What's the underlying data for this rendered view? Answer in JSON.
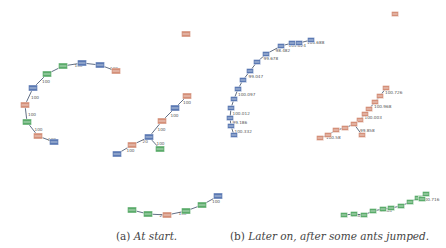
{
  "colors": {
    "blue": "#5b79b3",
    "salmon": "#d48f78",
    "green": "#5aab6a",
    "edge": "#3a4a66",
    "label": "#555555"
  },
  "captions": {
    "a": {
      "prefix": "(a)",
      "text": "At start."
    },
    "b": {
      "prefix": "(b)",
      "text": "Later on, after some ants jumped."
    }
  },
  "panels": [
    {
      "id": "a",
      "nodes": [
        {
          "x": 63,
          "y": 66,
          "c": "green"
        },
        {
          "x": 82,
          "y": 63,
          "c": "blue"
        },
        {
          "x": 100,
          "y": 65,
          "c": "blue"
        },
        {
          "x": 116,
          "y": 71,
          "c": "salmon"
        },
        {
          "x": 47,
          "y": 74,
          "c": "green"
        },
        {
          "x": 33,
          "y": 88,
          "c": "blue"
        },
        {
          "x": 25,
          "y": 105,
          "c": "salmon"
        },
        {
          "x": 27,
          "y": 122,
          "c": "green"
        },
        {
          "x": 38,
          "y": 136,
          "c": "salmon"
        },
        {
          "x": 54,
          "y": 142,
          "c": "blue"
        },
        {
          "x": 186,
          "y": 34,
          "c": "salmon"
        },
        {
          "x": 187,
          "y": 96,
          "c": "salmon"
        },
        {
          "x": 175,
          "y": 108,
          "c": "blue"
        },
        {
          "x": 162,
          "y": 121,
          "c": "salmon"
        },
        {
          "x": 149,
          "y": 137,
          "c": "blue"
        },
        {
          "x": 160,
          "y": 149,
          "c": "green"
        },
        {
          "x": 132,
          "y": 145,
          "c": "salmon"
        },
        {
          "x": 117,
          "y": 154,
          "c": "blue"
        },
        {
          "x": 132,
          "y": 210,
          "c": "green"
        },
        {
          "x": 148,
          "y": 214,
          "c": "green"
        },
        {
          "x": 167,
          "y": 215,
          "c": "salmon"
        },
        {
          "x": 186,
          "y": 211,
          "c": "green"
        },
        {
          "x": 202,
          "y": 205,
          "c": "green"
        },
        {
          "x": 218,
          "y": 196,
          "c": "blue"
        }
      ],
      "edges": [
        {
          "a": 0,
          "b": 1,
          "label": "100"
        },
        {
          "a": 1,
          "b": 2,
          "label": ""
        },
        {
          "a": 2,
          "b": 3,
          "label": "100"
        },
        {
          "a": 4,
          "b": 0,
          "label": ""
        },
        {
          "a": 5,
          "b": 4,
          "label": "100"
        },
        {
          "a": 6,
          "b": 5,
          "label": "100"
        },
        {
          "a": 7,
          "b": 6,
          "label": "100"
        },
        {
          "a": 8,
          "b": 7,
          "label": "100"
        },
        {
          "a": 9,
          "b": 8,
          "label": "100"
        },
        {
          "a": 11,
          "b": 12,
          "label": "100"
        },
        {
          "a": 12,
          "b": 13,
          "label": "100"
        },
        {
          "a": 13,
          "b": 14,
          "label": "100"
        },
        {
          "a": 14,
          "b": 15,
          "label": "100"
        },
        {
          "a": 14,
          "b": 16,
          "label": "20"
        },
        {
          "a": 16,
          "b": 17,
          "label": "100"
        },
        {
          "a": 18,
          "b": 19,
          "label": ""
        },
        {
          "a": 19,
          "b": 20,
          "label": "20"
        },
        {
          "a": 20,
          "b": 21,
          "label": "100"
        },
        {
          "a": 21,
          "b": 22,
          "label": ""
        },
        {
          "a": 22,
          "b": 23,
          "label": "100"
        }
      ]
    },
    {
      "id": "b",
      "nodes": [
        {
          "x": 311,
          "y": 40,
          "c": "blue"
        },
        {
          "x": 299,
          "y": 43,
          "c": "blue"
        },
        {
          "x": 292,
          "y": 43,
          "c": "blue"
        },
        {
          "x": 281,
          "y": 46,
          "c": "blue"
        },
        {
          "x": 266,
          "y": 54,
          "c": "blue"
        },
        {
          "x": 257,
          "y": 62,
          "c": "blue"
        },
        {
          "x": 250,
          "y": 71,
          "c": "blue"
        },
        {
          "x": 243,
          "y": 80,
          "c": "blue"
        },
        {
          "x": 238,
          "y": 89,
          "c": "blue"
        },
        {
          "x": 234,
          "y": 99,
          "c": "blue"
        },
        {
          "x": 231,
          "y": 108,
          "c": "blue"
        },
        {
          "x": 230,
          "y": 118,
          "c": "blue"
        },
        {
          "x": 231,
          "y": 126,
          "c": "blue"
        },
        {
          "x": 234,
          "y": 135,
          "c": "blue"
        },
        {
          "x": 395,
          "y": 14,
          "c": "salmon"
        },
        {
          "x": 386,
          "y": 88,
          "c": "salmon"
        },
        {
          "x": 380,
          "y": 96,
          "c": "salmon"
        },
        {
          "x": 375,
          "y": 102,
          "c": "salmon"
        },
        {
          "x": 369,
          "y": 109,
          "c": "salmon"
        },
        {
          "x": 365,
          "y": 114,
          "c": "salmon"
        },
        {
          "x": 360,
          "y": 120,
          "c": "salmon"
        },
        {
          "x": 354,
          "y": 124,
          "c": "salmon"
        },
        {
          "x": 345,
          "y": 128,
          "c": "salmon"
        },
        {
          "x": 336,
          "y": 130,
          "c": "salmon"
        },
        {
          "x": 328,
          "y": 135,
          "c": "salmon"
        },
        {
          "x": 320,
          "y": 138,
          "c": "salmon"
        },
        {
          "x": 362,
          "y": 135,
          "c": "salmon"
        },
        {
          "x": 344,
          "y": 215,
          "c": "green"
        },
        {
          "x": 354,
          "y": 214,
          "c": "green"
        },
        {
          "x": 364,
          "y": 215,
          "c": "green"
        },
        {
          "x": 373,
          "y": 211,
          "c": "green"
        },
        {
          "x": 383,
          "y": 209,
          "c": "green"
        },
        {
          "x": 391,
          "y": 208,
          "c": "green"
        },
        {
          "x": 401,
          "y": 206,
          "c": "green"
        },
        {
          "x": 410,
          "y": 202,
          "c": "green"
        },
        {
          "x": 418,
          "y": 198,
          "c": "green"
        },
        {
          "x": 426,
          "y": 194,
          "c": "green"
        },
        {
          "x": 422,
          "y": 199,
          "c": "green"
        }
      ],
      "edges": [
        {
          "a": 0,
          "b": 1,
          "label": "104.688"
        },
        {
          "a": 1,
          "b": 2,
          "label": ""
        },
        {
          "a": 2,
          "b": 3,
          "label": "101.624"
        },
        {
          "a": 3,
          "b": 4,
          "label": "98.482"
        },
        {
          "a": 4,
          "b": 5,
          "label": "99.678"
        },
        {
          "a": 5,
          "b": 6,
          "label": ""
        },
        {
          "a": 6,
          "b": 7,
          "label": "99.047"
        },
        {
          "a": 7,
          "b": 8,
          "label": ""
        },
        {
          "a": 8,
          "b": 9,
          "label": "100.097"
        },
        {
          "a": 9,
          "b": 10,
          "label": ""
        },
        {
          "a": 10,
          "b": 11,
          "label": "100.012"
        },
        {
          "a": 11,
          "b": 12,
          "label": "99.186"
        },
        {
          "a": 12,
          "b": 13,
          "label": "100.332"
        },
        {
          "a": 15,
          "b": 16,
          "label": "100.726"
        },
        {
          "a": 16,
          "b": 17,
          "label": ""
        },
        {
          "a": 17,
          "b": 18,
          "label": "100.968"
        },
        {
          "a": 18,
          "b": 19,
          "label": ""
        },
        {
          "a": 19,
          "b": 20,
          "label": "100.003"
        },
        {
          "a": 20,
          "b": 21,
          "label": ""
        },
        {
          "a": 21,
          "b": 22,
          "label": ""
        },
        {
          "a": 22,
          "b": 23,
          "label": ""
        },
        {
          "a": 23,
          "b": 24,
          "label": ""
        },
        {
          "a": 24,
          "b": 25,
          "label": "100.58"
        },
        {
          "a": 21,
          "b": 26,
          "label": "99.858"
        },
        {
          "a": 27,
          "b": 28,
          "label": "97.036"
        },
        {
          "a": 28,
          "b": 29,
          "label": ""
        },
        {
          "a": 29,
          "b": 30,
          "label": ""
        },
        {
          "a": 30,
          "b": 31,
          "label": "97.03"
        },
        {
          "a": 31,
          "b": 32,
          "label": ""
        },
        {
          "a": 32,
          "b": 33,
          "label": ""
        },
        {
          "a": 33,
          "b": 34,
          "label": ""
        },
        {
          "a": 34,
          "b": 35,
          "label": ""
        },
        {
          "a": 35,
          "b": 36,
          "label": ""
        },
        {
          "a": 35,
          "b": 37,
          "label": "100.716"
        }
      ]
    }
  ]
}
